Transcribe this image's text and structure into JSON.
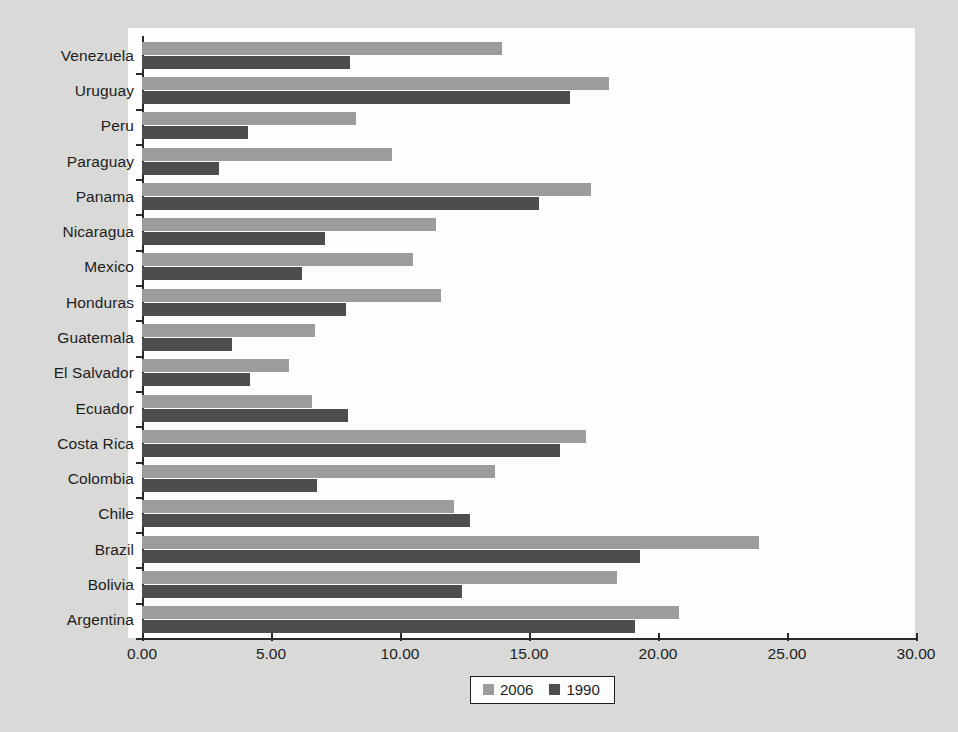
{
  "chart_data": {
    "type": "bar",
    "orientation": "horizontal",
    "title": "",
    "xlabel": "",
    "ylabel": "",
    "xlim": [
      0,
      30
    ],
    "xticks": [
      "0.00",
      "5.00",
      "10.00",
      "15.00",
      "20.00",
      "25.00",
      "30.00"
    ],
    "xtick_values": [
      0,
      5,
      10,
      15,
      20,
      25,
      30
    ],
    "grid": false,
    "legend_position": "bottom-center",
    "categories": [
      "Venezuela",
      "Uruguay",
      "Peru",
      "Paraguay",
      "Panama",
      "Nicaragua",
      "Mexico",
      "Honduras",
      "Guatemala",
      "El Salvador",
      "Ecuador",
      "Costa Rica",
      "Colombia",
      "Chile",
      "Brazil",
      "Bolivia",
      "Argentina"
    ],
    "series": [
      {
        "name": "2006",
        "color": "#9c9c9c",
        "values": [
          13.95,
          18.1,
          8.3,
          9.7,
          17.4,
          11.4,
          10.5,
          11.6,
          6.7,
          5.7,
          6.6,
          17.2,
          13.7,
          12.1,
          23.9,
          18.4,
          20.8
        ]
      },
      {
        "name": "1990",
        "color": "#4d4d4d",
        "values": [
          8.05,
          16.6,
          4.1,
          3.0,
          15.4,
          7.1,
          6.2,
          7.9,
          3.5,
          4.2,
          8.0,
          16.2,
          6.8,
          12.7,
          19.3,
          12.4,
          19.1
        ]
      }
    ]
  },
  "legend": {
    "items": [
      {
        "label": "2006",
        "color": "#9c9c9c"
      },
      {
        "label": "1990",
        "color": "#4d4d4d"
      }
    ]
  },
  "colors": {
    "page_background": "#d9d9d7",
    "plot_background": "#fdfdfd",
    "axis": "#2a2a2a",
    "text": "#1d1d1d",
    "series_2006": "#9c9c9c",
    "series_1990": "#4d4d4d"
  }
}
